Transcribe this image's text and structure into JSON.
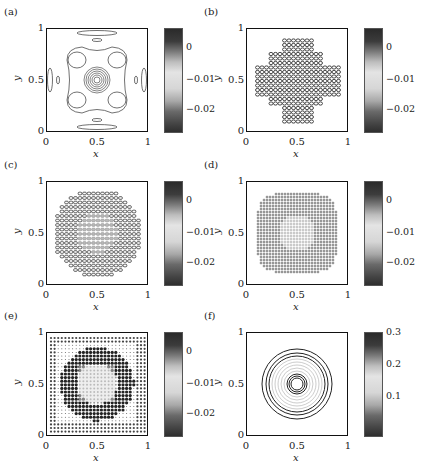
{
  "chart_data": [
    {
      "type": "heatmap",
      "panel_label": "(a)",
      "xlabel": "x",
      "ylabel": "y",
      "xlim": [
        0,
        1
      ],
      "ylim": [
        0,
        1
      ],
      "xticks": [
        "0",
        "0.5",
        "1"
      ],
      "yticks": [
        "0",
        "0.5",
        "1"
      ],
      "colorbar": {
        "ticks": [
          "0",
          "-0.01",
          "-0.02"
        ],
        "range": [
          -0.028,
          0.005
        ],
        "colormap": "gray-bands"
      },
      "description": "Contour plot: concentrated rings at center (0.5,0.5), four clover lobes, small ellipses at edge midpoints"
    },
    {
      "type": "heatmap",
      "panel_label": "(b)",
      "xlabel": "x",
      "ylabel": "y",
      "xlim": [
        0,
        1
      ],
      "ylim": [
        0,
        1
      ],
      "xticks": [
        "0",
        "0.5",
        "1"
      ],
      "yticks": [
        "0",
        "0.5",
        "1"
      ],
      "colorbar": {
        "ticks": [
          "0",
          "-0.01",
          "-0.02"
        ],
        "range": [
          -0.028,
          0.005
        ],
        "colormap": "gray-bands"
      },
      "description": "Dense cross-shaped pattern of small contour ellipses centered at (0.5,0.5)"
    },
    {
      "type": "heatmap",
      "panel_label": "(c)",
      "xlabel": "x",
      "ylabel": "y",
      "xlim": [
        0,
        1
      ],
      "ylim": [
        0,
        1
      ],
      "xticks": [
        "0",
        "0.5",
        "1"
      ],
      "yticks": [
        "0",
        "0.5",
        "1"
      ],
      "colorbar": {
        "ticks": [
          "0",
          "-0.01",
          "-0.02"
        ],
        "range": [
          -0.028,
          0.005
        ],
        "colormap": "gray-bands"
      },
      "description": "Circular disk of small contour cells, lighter gridded core, radius ~0.45"
    },
    {
      "type": "heatmap",
      "panel_label": "(d)",
      "xlabel": "x",
      "ylabel": "y",
      "xlim": [
        0,
        1
      ],
      "ylim": [
        0,
        1
      ],
      "xticks": [
        "0",
        "0.5",
        "1"
      ],
      "yticks": [
        "0",
        "0.5",
        "1"
      ],
      "colorbar": {
        "ticks": [
          "0",
          "-0.01",
          "-0.02"
        ],
        "range": [
          -0.028,
          0.005
        ],
        "colormap": "gray-bands"
      },
      "description": "Octagonal disk of dense cross-hatched contours, darker ring around gridded center"
    },
    {
      "type": "heatmap",
      "panel_label": "(e)",
      "xlabel": "x",
      "ylabel": "y",
      "xlim": [
        0,
        1
      ],
      "ylim": [
        0,
        1
      ],
      "xticks": [
        "0",
        "0.5",
        "1"
      ],
      "yticks": [
        "0",
        "0.5",
        "1"
      ],
      "colorbar": {
        "ticks": [
          "0",
          "-0.01",
          "-0.02"
        ],
        "range": [
          -0.028,
          0.005
        ],
        "colormap": "gray-bands"
      },
      "description": "Dot-grid field; dark annulus radius ~0.3 around light square core, darker dots at corners"
    },
    {
      "type": "heatmap",
      "panel_label": "(f)",
      "xlabel": "x",
      "ylabel": "y",
      "xlim": [
        0,
        1
      ],
      "ylim": [
        0,
        1
      ],
      "xticks": [
        "0",
        "0.5",
        "1"
      ],
      "yticks": [
        "0",
        "0.5",
        "1"
      ],
      "colorbar": {
        "ticks": [
          "0.3",
          "0.2",
          "0.1"
        ],
        "range": [
          0.02,
          0.3
        ],
        "colormap": "gray-bands"
      },
      "description": "Concentric circular contours centered at (0.5,0.5), outer radius ~0.35, inner ring ~0.07"
    }
  ]
}
